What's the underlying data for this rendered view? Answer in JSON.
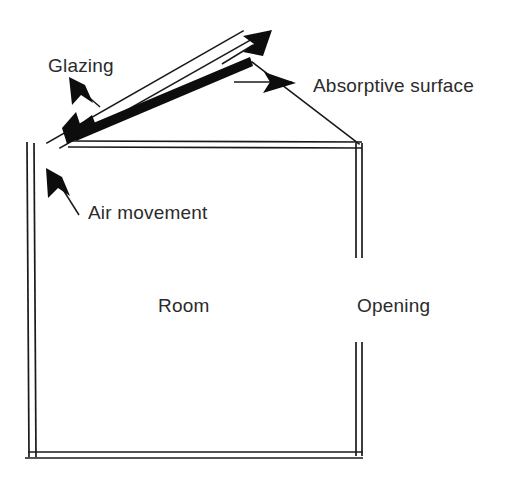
{
  "figure": {
    "background_color": "#ffffff",
    "line_color": "#1a1a1a",
    "fill_color": "#0d0d0d",
    "text_color": "#2b2b2b",
    "width": 516,
    "height": 482
  },
  "labels": {
    "glazing": "Glazing",
    "absorptive_surface": "Absorptive surface",
    "air_movement": "Air movement",
    "room": "Room",
    "opening": "Opening"
  },
  "elements": {
    "glazing_panel": "Glazing",
    "absorber_plate": "Absorptive surface",
    "room_enclosure": "Room",
    "wall_opening": "Opening",
    "airflow_indicators": "Air movement"
  },
  "annotations": [
    {
      "name": "glazing-label",
      "text": "Glazing",
      "x": 48,
      "y": 72,
      "anchor": "start",
      "leader": "arrow pointing up-left to glazing pane"
    },
    {
      "name": "absorptive-surface-label",
      "text": "Absorptive surface",
      "x": 313,
      "y": 92,
      "anchor": "start",
      "leader": "horizontal leader with arrowhead pointing right at absorber ridge"
    },
    {
      "name": "air-movement-label",
      "text": "Air movement",
      "x": 88,
      "y": 219,
      "anchor": "start",
      "leader": "arrow pointing up-left indicating inflow along interior wall"
    },
    {
      "name": "room-label",
      "text": "Room",
      "x": 158,
      "y": 312,
      "anchor": "start",
      "leader": "none"
    },
    {
      "name": "opening-label",
      "text": "Opening",
      "x": 357,
      "y": 312,
      "anchor": "start",
      "leader": "none"
    }
  ],
  "geometry": {
    "glazing_pane": {
      "description": "Thin double line running up-right from eave to ridge",
      "lower_edge": [
        [
          48,
          142
        ],
        [
          242,
          32
        ]
      ],
      "upper_edge": [
        [
          58,
          148
        ],
        [
          252,
          40
        ]
      ]
    },
    "absorber_plate": {
      "description": "Thick black bar parallel to and below the glazing",
      "start": [
        72,
        136
      ],
      "end": [
        250,
        62
      ],
      "thickness": 9
    },
    "roof_right_slope": {
      "description": "Thin line from ridge down-right to top of right wall",
      "points": [
        [
          253,
          63
        ],
        [
          358,
          143
        ]
      ]
    },
    "ceiling": {
      "description": "Double horizontal line forming the room ceiling",
      "y_top": 141,
      "y_bottom": 147,
      "x_start": 68,
      "x_end": 362
    },
    "left_wall": {
      "description": "Double vertical line, slightly slanted, forming the left wall",
      "x_outer_top": 27,
      "x_outer_bottom": 29,
      "x_inner_top": 34,
      "x_inner_bottom": 36,
      "y_top": 142,
      "y_bottom": 457
    },
    "right_wall": {
      "description": "Double vertical line with a gap forming the opening",
      "x_outer": 356,
      "x_inner": 362,
      "segment_upper": [
        143,
        258
      ],
      "segment_lower": [
        342,
        457
      ]
    },
    "floor": {
      "description": "Double horizontal line forming the room floor",
      "y_top": 452,
      "y_bottom": 458,
      "x_start": 28,
      "x_end": 362
    },
    "airflow_arrows": [
      {
        "name": "inlet-arrow",
        "description": "Down-left arrowhead at lower end of absorber channel",
        "tip": [
          70,
          141
        ],
        "direction": "down-left"
      },
      {
        "name": "outlet-arrow",
        "description": "Up-right arrow above ridge showing warm air exhaust",
        "tail": [
          222,
          62
        ],
        "tip": [
          270,
          32
        ],
        "direction": "up-right"
      },
      {
        "name": "room-inflow-arrow",
        "description": "Up-left arrow inside room along left wall",
        "tail": [
          78,
          214
        ],
        "tip": [
          49,
          171
        ],
        "direction": "up-left"
      },
      {
        "name": "glazing-pointer-arrow",
        "description": "Up-left arrow from Glazing label to glazing pane",
        "tail": [
          99,
          106
        ],
        "tip": [
          71,
          79
        ],
        "direction": "up-left"
      }
    ]
  }
}
